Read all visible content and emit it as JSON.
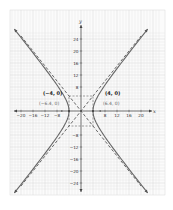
{
  "chart_data": {
    "type": "line",
    "title": "",
    "xlabel": "x",
    "ylabel": "y",
    "xlim": [
      -22,
      22
    ],
    "ylim": [
      -26,
      26
    ],
    "grid": true,
    "x_ticks": [
      -20,
      -16,
      -12,
      -8,
      8,
      12,
      16,
      20
    ],
    "y_ticks": [
      24,
      20,
      16,
      12,
      8,
      -8,
      -12,
      -16,
      -20,
      -24
    ],
    "x_tick_labels": [
      "−20",
      "−16",
      "−12",
      "−8",
      "8",
      "12",
      "16",
      "20"
    ],
    "y_tick_labels": [
      "24",
      "20",
      "16",
      "12",
      "8",
      "−8",
      "−12",
      "−16",
      "−20",
      "−24"
    ],
    "series": [
      {
        "name": "hyperbola",
        "style": "solid",
        "equation": "x^2/16 - y^2/25 = 1",
        "a": 4,
        "b": 5
      },
      {
        "name": "asymptote y = 1.25x",
        "style": "dashed",
        "slope": 1.25
      },
      {
        "name": "asymptote y = -1.25x",
        "style": "dashed",
        "slope": -1.25
      }
    ],
    "annotations": [
      {
        "text": "(−4, 0)",
        "x": -4,
        "y": 0,
        "kind": "vertex"
      },
      {
        "text": "(4, 0)",
        "x": 4,
        "y": 0,
        "kind": "vertex"
      },
      {
        "text": "(−6.4, 0)",
        "x": -6.4,
        "y": 0,
        "kind": "focus"
      },
      {
        "text": "(6.4, 0)",
        "x": 6.4,
        "y": 0,
        "kind": "focus"
      }
    ],
    "fundamental_rectangle": {
      "x": [
        -4,
        4
      ],
      "y": [
        -5,
        5
      ],
      "style": "dashed"
    }
  },
  "labels": {
    "x_axis": "x",
    "y_axis": "y",
    "vertex_left": "(−4, 0)",
    "vertex_right": "(4, 0)",
    "focus_left": "(−6.4, 0)",
    "focus_right": "(6.4, 0)"
  }
}
